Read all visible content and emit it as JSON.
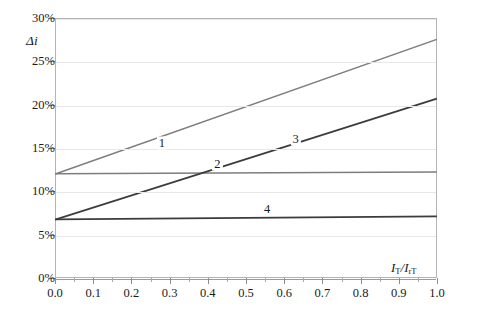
{
  "chart_data": {
    "type": "line",
    "title": "",
    "xlabel": "I_T/I_rT",
    "ylabel": "Δi",
    "xlim": [
      0.0,
      1.0
    ],
    "ylim": [
      0.0,
      30.0
    ],
    "grid": true,
    "legend": "inline-curve-numbers",
    "x": [
      0.0,
      1.0
    ],
    "series": [
      {
        "name": "1",
        "label": "1",
        "color": "#7d7d7d",
        "width": 1.6,
        "values": [
          12.0,
          27.6
        ],
        "label_x": 0.28,
        "label_y": 15.6
      },
      {
        "name": "2",
        "label": "2",
        "color": "#7d7d7d",
        "width": 1.6,
        "values": [
          12.0,
          12.2
        ],
        "label_x": 0.425,
        "label_y": 13.1
      },
      {
        "name": "3",
        "label": "3",
        "color": "#3c3c3c",
        "width": 1.8,
        "values": [
          6.7,
          20.7
        ],
        "label_x": 0.63,
        "label_y": 16.0
      },
      {
        "name": "4",
        "label": "4",
        "color": "#3c3c3c",
        "width": 1.8,
        "values": [
          6.7,
          7.05
        ],
        "label_x": 0.555,
        "label_y": 8.0
      }
    ],
    "y_ticks": [
      {
        "value": 0,
        "label": "0%"
      },
      {
        "value": 5,
        "label": "5%"
      },
      {
        "value": 10,
        "label": "10%"
      },
      {
        "value": 15,
        "label": "15%"
      },
      {
        "value": 20,
        "label": "20%"
      },
      {
        "value": 25,
        "label": "25%"
      },
      {
        "value": 30,
        "label": "30%"
      }
    ],
    "x_ticks": [
      {
        "value": 0.0,
        "label": "0.0"
      },
      {
        "value": 0.1,
        "label": "0.1"
      },
      {
        "value": 0.2,
        "label": "0.2"
      },
      {
        "value": 0.3,
        "label": "0.3"
      },
      {
        "value": 0.4,
        "label": "0.4"
      },
      {
        "value": 0.5,
        "label": "0.5"
      },
      {
        "value": 0.6,
        "label": "0.6"
      },
      {
        "value": 0.7,
        "label": "0.7"
      },
      {
        "value": 0.8,
        "label": "0.8"
      },
      {
        "value": 0.9,
        "label": "0.9"
      },
      {
        "value": 1.0,
        "label": "1.0"
      }
    ],
    "x_minor_ticks": [
      0.05,
      0.15,
      0.25,
      0.35,
      0.45,
      0.55,
      0.65,
      0.75,
      0.85,
      0.95
    ],
    "colors": {
      "grid": "#e8e8e8",
      "frame": "#b4b4b4",
      "axis": "#8c8c8c",
      "baseline": "#9a9a9a",
      "text": "#1a1a1a",
      "series_light": "#7d7d7d",
      "series_dark": "#3c3c3c",
      "background": "#ffffff"
    }
  },
  "axis_titles": {
    "y": {
      "delta": "Δ",
      "variable": "i"
    },
    "x": {
      "numerator_symbol": "I",
      "numerator_sub": "T",
      "separator": "/",
      "denominator_symbol": "I",
      "denominator_sub": "rT",
      "full": "I_T/I_rT"
    }
  }
}
